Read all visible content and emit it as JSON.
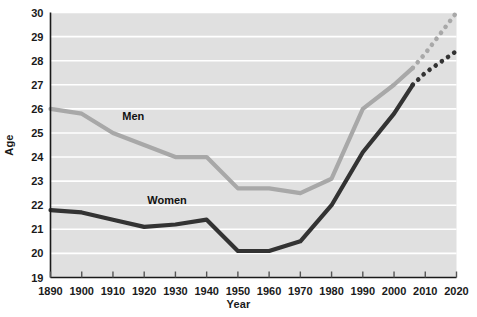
{
  "chart_data": {
    "type": "line",
    "title": "",
    "xlabel": "Year",
    "ylabel": "Age",
    "xlim": [
      1890,
      2020
    ],
    "ylim": [
      19,
      30
    ],
    "grid": true,
    "legend_position": "inline-annotation",
    "xticks": [
      1890,
      1900,
      1910,
      1920,
      1930,
      1940,
      1950,
      1960,
      1970,
      1980,
      1990,
      2000,
      2010,
      2020
    ],
    "yticks": [
      19,
      20,
      21,
      22,
      23,
      24,
      25,
      26,
      27,
      28,
      29,
      30
    ],
    "colors": {
      "men": "#a8a8a8",
      "women": "#333333",
      "plot_background": "#e0e0e0",
      "gridline": "#ffffff",
      "axis": "#1a1a1a"
    },
    "series": [
      {
        "name": "Men",
        "color": "#a8a8a8",
        "style": "solid",
        "x": [
          1890,
          1900,
          1910,
          1920,
          1930,
          1940,
          1950,
          1960,
          1970,
          1980,
          1990,
          2000,
          2006
        ],
        "values": [
          26.0,
          25.8,
          25.0,
          24.5,
          24.0,
          24.0,
          22.7,
          22.7,
          22.5,
          23.1,
          26.0,
          27.0,
          27.7
        ]
      },
      {
        "name": "Men projected",
        "color": "#a8a8a8",
        "style": "dotted",
        "x": [
          2006,
          2010,
          2020
        ],
        "values": [
          27.7,
          28.3,
          30.0
        ]
      },
      {
        "name": "Women",
        "color": "#333333",
        "style": "solid",
        "x": [
          1890,
          1900,
          1910,
          1920,
          1930,
          1940,
          1950,
          1960,
          1970,
          1980,
          1990,
          2000,
          2006
        ],
        "values": [
          21.8,
          21.7,
          21.4,
          21.1,
          21.2,
          21.4,
          20.1,
          20.1,
          20.5,
          22.0,
          24.2,
          25.8,
          27.0
        ]
      },
      {
        "name": "Women projected",
        "color": "#333333",
        "style": "dotted",
        "x": [
          2006,
          2010,
          2020
        ],
        "values": [
          27.0,
          27.5,
          28.4
        ]
      }
    ],
    "annotations": [
      {
        "text": "Men",
        "x": 1913,
        "y": 25.55
      },
      {
        "text": "Women",
        "x": 1921,
        "y": 22.05
      }
    ]
  }
}
